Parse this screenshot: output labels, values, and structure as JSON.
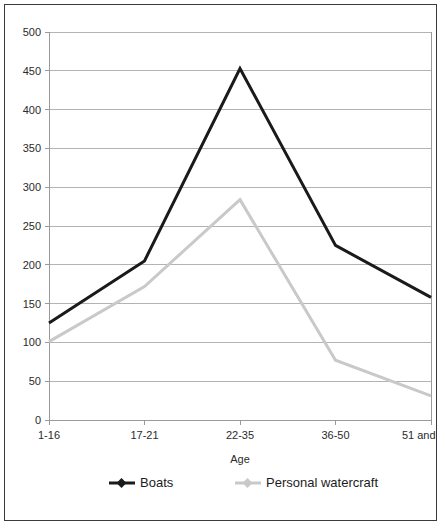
{
  "chart_data": {
    "type": "line",
    "title": "",
    "xlabel": "Age",
    "ylabel": "",
    "categories": [
      "1-16",
      "17-21",
      "22-35",
      "36-50",
      "51 and over"
    ],
    "ylim": [
      0,
      500
    ],
    "yticks": [
      0,
      50,
      100,
      150,
      200,
      250,
      300,
      350,
      400,
      450,
      500
    ],
    "ytick_labels": [
      "0",
      "50",
      "100",
      "150",
      "200",
      "250",
      "300",
      "350",
      "400",
      "450",
      "500"
    ],
    "grid": true,
    "legend_position": "bottom",
    "series": [
      {
        "name": "Boats",
        "color": "#1a1a1a",
        "width": 3,
        "values": [
          125,
          205,
          453,
          225,
          158
        ]
      },
      {
        "name": "Personal watercraft",
        "color": "#c9c9c9",
        "width": 3,
        "values": [
          101,
          172,
          284,
          77,
          31
        ]
      }
    ]
  },
  "legend": {
    "entries": [
      {
        "label": "Boats"
      },
      {
        "label": "Personal watercraft"
      }
    ]
  },
  "frame": {
    "border_color": "#3a3a3a",
    "background": "#ffffff"
  }
}
